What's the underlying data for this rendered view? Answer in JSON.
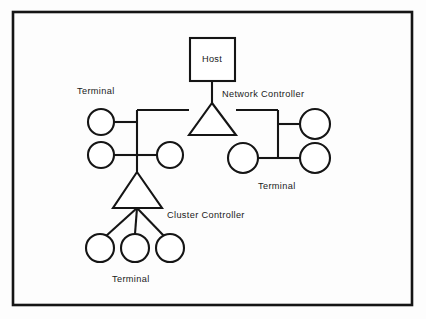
{
  "diagram": {
    "background_color": "#fdfdfd",
    "line_color": "#151515",
    "frame": {
      "x": 13,
      "y": 12,
      "width": 399,
      "height": 293
    },
    "nodes": {
      "host": {
        "label": "Host",
        "shape": "rectangle",
        "x": 190,
        "y": 38,
        "width": 45,
        "height": 43,
        "label_x": 212,
        "label_y": 62
      },
      "network_controller": {
        "label": "Network Controller",
        "shape": "triangle",
        "apex_x": 212,
        "apex_y": 103,
        "base_left_x": 189,
        "base_right_x": 236,
        "base_y": 135,
        "label_x": 222,
        "label_y": 97
      },
      "cluster_controller": {
        "label": "Cluster Controller",
        "shape": "triangle",
        "apex_x": 137,
        "apex_y": 172,
        "base_left_x": 113,
        "base_right_x": 162,
        "base_y": 208,
        "label_x": 167,
        "label_y": 218
      }
    },
    "labels": {
      "terminal_top_left": {
        "text": "Terminal",
        "x": 77,
        "y": 94
      },
      "terminal_right": {
        "text": "Terminal",
        "x": 258,
        "y": 189
      },
      "terminal_bottom": {
        "text": "Terminal",
        "x": 112,
        "y": 282
      }
    },
    "terminals": [
      {
        "name": "terminal-left-upper",
        "cx": 101,
        "cy": 122,
        "r": 13
      },
      {
        "name": "terminal-left-lower",
        "cx": 101,
        "cy": 155,
        "r": 13
      },
      {
        "name": "terminal-mid-right",
        "cx": 170,
        "cy": 155,
        "r": 13
      },
      {
        "name": "terminal-right-upper",
        "cx": 315,
        "cy": 124,
        "r": 15
      },
      {
        "name": "terminal-right-lower",
        "cx": 315,
        "cy": 158,
        "r": 15
      },
      {
        "name": "terminal-right-inner",
        "cx": 243,
        "cy": 158,
        "r": 15
      },
      {
        "name": "terminal-cluster-1",
        "cx": 100,
        "cy": 248,
        "r": 14
      },
      {
        "name": "terminal-cluster-2",
        "cx": 135,
        "cy": 248,
        "r": 14
      },
      {
        "name": "terminal-cluster-3",
        "cx": 170,
        "cy": 248,
        "r": 14
      }
    ],
    "connections": [
      {
        "name": "host-to-network-controller",
        "path": "M 212 81 L 212 103"
      },
      {
        "name": "bus-left-segment",
        "path": "M 137 110 L 189 110"
      },
      {
        "name": "bus-right-segment",
        "path": "M 236 110 L 278 110"
      },
      {
        "name": "left-trunk-vertical",
        "path": "M 137 110 L 137 172"
      },
      {
        "name": "terminal-left-upper-link",
        "path": "M 114 122 L 137 122"
      },
      {
        "name": "terminal-left-lower-link",
        "path": "M 114 155 L 137 155"
      },
      {
        "name": "terminal-mid-right-link",
        "path": "M 137 155 L 157 155"
      },
      {
        "name": "right-trunk-vertical",
        "path": "M 278 110 L 278 158"
      },
      {
        "name": "terminal-right-upper-link",
        "path": "M 278 124 L 300 124"
      },
      {
        "name": "terminal-right-lower-link",
        "path": "M 278 158 L 300 158"
      },
      {
        "name": "terminal-right-inner-link",
        "path": "M 258 158 L 278 158"
      },
      {
        "name": "cluster-spoke-left",
        "path": "M 137 208 L 106 236"
      },
      {
        "name": "cluster-spoke-center",
        "path": "M 137 208 L 135 234"
      },
      {
        "name": "cluster-spoke-right",
        "path": "M 137 208 L 164 236"
      }
    ]
  }
}
